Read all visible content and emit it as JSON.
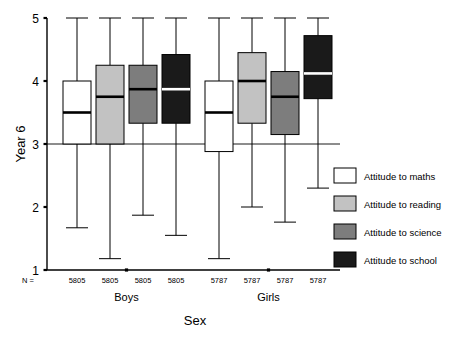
{
  "chart_data": {
    "type": "box",
    "title": "",
    "xlabel": "Sex",
    "ylabel": "Year 6",
    "ylim": [
      1,
      5
    ],
    "ytick_labels": [
      "1",
      "2",
      "3",
      "4",
      "5"
    ],
    "ytick_values": [
      1,
      2,
      3,
      4,
      5
    ],
    "grid": false,
    "reference_line": 3,
    "legend_position": "right",
    "n_prefix": "N =",
    "categories": [
      "Boys",
      "Girls"
    ],
    "series": [
      {
        "name": "Attitude to maths",
        "color": "#ffffff",
        "boxes": [
          {
            "group": "Boys",
            "n": "5805",
            "whisker_low": 1.67,
            "q1": 3.0,
            "median": 3.5,
            "q3": 4.0,
            "whisker_high": 5.0
          },
          {
            "group": "Girls",
            "n": "5787",
            "whisker_low": 1.18,
            "q1": 2.88,
            "median": 3.5,
            "q3": 4.0,
            "whisker_high": 5.0
          }
        ]
      },
      {
        "name": "Attitude to reading",
        "color": "#c2c2c2",
        "boxes": [
          {
            "group": "Boys",
            "n": "5805",
            "whisker_low": 1.18,
            "q1": 3.0,
            "median": 3.75,
            "q3": 4.25,
            "whisker_high": 5.0
          },
          {
            "group": "Girls",
            "n": "5787",
            "whisker_low": 2.0,
            "q1": 3.33,
            "median": 4.0,
            "q3": 4.45,
            "whisker_high": 5.0
          }
        ]
      },
      {
        "name": "Attitude to science",
        "color": "#7d7d7d",
        "boxes": [
          {
            "group": "Boys",
            "n": "5805",
            "whisker_low": 1.87,
            "q1": 3.33,
            "median": 3.87,
            "q3": 4.25,
            "whisker_high": 5.0
          },
          {
            "group": "Girls",
            "n": "5787",
            "whisker_low": 1.76,
            "q1": 3.15,
            "median": 3.75,
            "q3": 4.15,
            "whisker_high": 5.0
          }
        ]
      },
      {
        "name": "Attitude to school",
        "color": "#1a1a1a",
        "boxes": [
          {
            "group": "Boys",
            "n": "5805",
            "whisker_low": 1.55,
            "q1": 3.33,
            "median": 3.87,
            "q3": 4.42,
            "whisker_high": 5.0
          },
          {
            "group": "Girls",
            "n": "5787",
            "whisker_low": 2.3,
            "q1": 3.72,
            "median": 4.12,
            "q3": 4.72,
            "whisker_high": 5.0
          }
        ]
      }
    ]
  },
  "legend": {
    "items": [
      {
        "label": "Attitude to maths",
        "color": "#ffffff"
      },
      {
        "label": "Attitude to reading",
        "color": "#c2c2c2"
      },
      {
        "label": "Attitude to science",
        "color": "#7d7d7d"
      },
      {
        "label": "Attitude to school",
        "color": "#1a1a1a"
      }
    ]
  }
}
